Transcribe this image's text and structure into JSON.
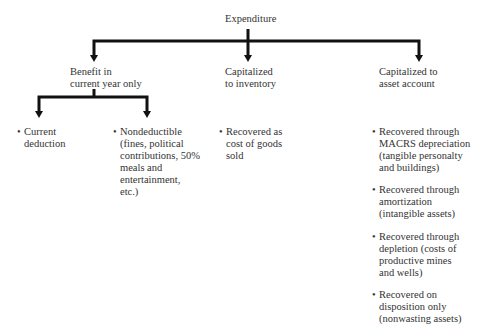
{
  "root": {
    "label": "Expenditure"
  },
  "level1": [
    {
      "lines": [
        "Benefit in",
        "current year only"
      ]
    },
    {
      "lines": [
        "Capitalized",
        "to inventory"
      ]
    },
    {
      "lines": [
        "Capitalized to",
        "asset account"
      ]
    }
  ],
  "benefit_children": [
    {
      "lines": [
        "Current",
        "deduction"
      ]
    },
    {
      "lines": [
        "Nondeductible",
        "(fines, political",
        "contributions, 50%",
        "meals and",
        "entertainment,",
        "etc.)"
      ]
    }
  ],
  "inventory_items": [
    {
      "lines": [
        "Recovered as",
        "cost of goods",
        "sold"
      ]
    }
  ],
  "asset_items": [
    {
      "lines": [
        "Recovered through",
        "MACRS depreciation",
        "(tangible personalty",
        "and buildings)"
      ]
    },
    {
      "lines": [
        "Recovered through",
        "amortization",
        "(intangible assets)"
      ]
    },
    {
      "lines": [
        "Recovered through",
        "depletion (costs of",
        "productive mines",
        "and wells)"
      ]
    },
    {
      "lines": [
        "Recovered on",
        "disposition only",
        "(nonwasting assets)"
      ]
    }
  ],
  "bullet": "•"
}
